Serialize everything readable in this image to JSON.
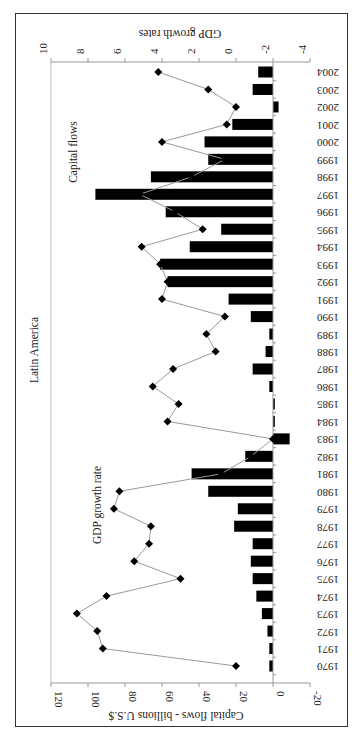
{
  "chart_data": {
    "type": "bar+line",
    "title": "Latin America",
    "orientation_note": "figure rotated 90° counter-clockwise on page",
    "categories": [
      "1970",
      "1971",
      "1972",
      "1973",
      "1974",
      "1975",
      "1976",
      "1977",
      "1978",
      "1979",
      "1980",
      "1981",
      "1982",
      "1983",
      "1984",
      "1985",
      "1986",
      "1987",
      "1988",
      "1989",
      "1990",
      "1991",
      "1992",
      "1993",
      "1994",
      "1995",
      "1996",
      "1997",
      "1998",
      "1999",
      "2000",
      "2001",
      "2002",
      "2003",
      "2004"
    ],
    "series": [
      {
        "name": "Capital flows",
        "type": "bar",
        "axis": "left",
        "values": [
          2,
          2,
          3,
          6,
          9,
          11,
          12,
          11,
          21,
          19,
          35,
          44,
          15,
          -9,
          -1,
          -1,
          2,
          11,
          4,
          2,
          12,
          24,
          57,
          61,
          45,
          28,
          58,
          96,
          66,
          35,
          37,
          22,
          -3,
          11,
          8
        ]
      },
      {
        "name": "GDP growth rate",
        "type": "line",
        "axis": "right",
        "values": [
          0.0,
          7.2,
          7.5,
          8.6,
          7.0,
          3.0,
          5.5,
          4.7,
          4.6,
          6.6,
          6.3,
          0.8,
          -0.8,
          -2.0,
          3.7,
          3.1,
          4.5,
          3.4,
          1.1,
          1.6,
          0.6,
          4.0,
          3.7,
          4.1,
          5.1,
          1.8,
          3.3,
          5.2,
          2.4,
          0.6,
          4.0,
          0.5,
          0.0,
          1.5,
          4.2
        ]
      }
    ],
    "ylabel": "Capital flows - billions U.S.$",
    "ylim": [
      -20,
      120
    ],
    "yticks": [
      "120",
      "100",
      "80",
      "60",
      "40",
      "20",
      "0",
      "-20"
    ],
    "y2label": "GDP growth rates",
    "y2lim": [
      -4,
      10
    ],
    "y2ticks": [
      "10",
      "8",
      "6",
      "4",
      "2",
      "0",
      "-2",
      "-4"
    ],
    "annotations": [
      "Capital flows",
      "GDP growth rate"
    ],
    "grid": false,
    "legend": "none (inline annotations)"
  },
  "labels": {
    "title": "Latin America",
    "left_axis_title": "Capital flows - billions U.S.$",
    "right_axis_title": "GDP growth rates",
    "annotation_capital": "Capital flows",
    "annotation_gdp": "GDP growth rate"
  }
}
